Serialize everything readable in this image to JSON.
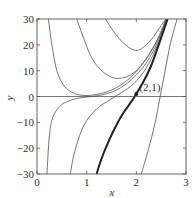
{
  "chart_data": {
    "type": "line",
    "title": "",
    "xlabel": "x",
    "ylabel": "y",
    "xlim": [
      0,
      3
    ],
    "ylim": [
      -30,
      30
    ],
    "xticks": [
      0,
      1,
      2,
      3
    ],
    "yticks": [
      -30,
      -20,
      -10,
      0,
      10,
      20,
      30
    ],
    "grid": false,
    "legend": null,
    "hline": 0,
    "annotation": {
      "text": "(2,1)",
      "x": 2,
      "y": 1
    },
    "series": [
      {
        "name": "curve-a",
        "emphasis": false,
        "points": [
          [
            0.23,
            30
          ],
          [
            0.3,
            20
          ],
          [
            0.4,
            10
          ],
          [
            0.55,
            4
          ],
          [
            0.75,
            1.2
          ],
          [
            0.95,
            0.4
          ],
          [
            1.2,
            0.8
          ],
          [
            1.5,
            2.5
          ],
          [
            1.8,
            6
          ],
          [
            2.1,
            12
          ],
          [
            2.4,
            21
          ],
          [
            2.6,
            30
          ]
        ]
      },
      {
        "name": "curve-b",
        "emphasis": false,
        "points": [
          [
            0.8,
            30
          ],
          [
            0.95,
            22
          ],
          [
            1.1,
            15
          ],
          [
            1.3,
            10
          ],
          [
            1.5,
            7.5
          ],
          [
            1.65,
            7
          ],
          [
            1.85,
            8
          ],
          [
            2.05,
            11
          ],
          [
            2.25,
            16
          ],
          [
            2.45,
            23
          ],
          [
            2.6,
            30
          ]
        ]
      },
      {
        "name": "curve-c",
        "emphasis": false,
        "points": [
          [
            1.38,
            30
          ],
          [
            1.55,
            25
          ],
          [
            1.75,
            20.5
          ],
          [
            1.95,
            18
          ],
          [
            2.1,
            18.5
          ],
          [
            2.3,
            22
          ],
          [
            2.5,
            27.5
          ],
          [
            2.6,
            30
          ]
        ]
      },
      {
        "name": "curve-d",
        "emphasis": false,
        "points": [
          [
            0.2,
            -30
          ],
          [
            0.25,
            -15
          ],
          [
            0.32,
            -8
          ],
          [
            0.45,
            -4
          ],
          [
            0.6,
            -2
          ],
          [
            0.8,
            -0.8
          ],
          [
            1.0,
            -0.2
          ],
          [
            1.3,
            0.6
          ],
          [
            1.6,
            2.5
          ],
          [
            1.9,
            6.5
          ],
          [
            2.2,
            13
          ],
          [
            2.45,
            22
          ],
          [
            2.6,
            30
          ]
        ]
      },
      {
        "name": "curve-e",
        "emphasis": false,
        "points": [
          [
            0.67,
            -30
          ],
          [
            0.75,
            -22
          ],
          [
            0.9,
            -13
          ],
          [
            1.05,
            -8
          ],
          [
            1.25,
            -4
          ],
          [
            1.45,
            -1.5
          ],
          [
            1.7,
            1.5
          ],
          [
            1.95,
            5
          ],
          [
            2.2,
            11
          ],
          [
            2.45,
            21
          ],
          [
            2.62,
            30
          ]
        ]
      },
      {
        "name": "curve-f",
        "emphasis": true,
        "points": [
          [
            1.2,
            -30
          ],
          [
            1.3,
            -24
          ],
          [
            1.45,
            -17
          ],
          [
            1.6,
            -11
          ],
          [
            1.75,
            -6
          ],
          [
            1.9,
            -2
          ],
          [
            2.0,
            1
          ],
          [
            2.15,
            6
          ],
          [
            2.3,
            12
          ],
          [
            2.45,
            20
          ],
          [
            2.63,
            30
          ]
        ]
      },
      {
        "name": "curve-g",
        "emphasis": false,
        "points": [
          [
            2.1,
            -30
          ],
          [
            2.25,
            -20
          ],
          [
            2.38,
            -10
          ],
          [
            2.48,
            0
          ],
          [
            2.58,
            10
          ],
          [
            2.68,
            20
          ],
          [
            2.82,
            30
          ]
        ]
      }
    ]
  },
  "axes": {
    "xlabel": "x",
    "ylabel": "y",
    "xtick_labels": [
      "0",
      "1",
      "2",
      "3"
    ],
    "ytick_labels": [
      "30",
      "20",
      "10",
      "0",
      "−10",
      "−20",
      "−30"
    ],
    "annotation": "(2,1)"
  }
}
